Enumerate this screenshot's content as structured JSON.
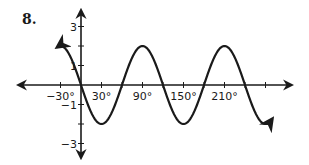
{
  "problem": {
    "number": "8."
  },
  "chart_data": {
    "type": "line",
    "title": "",
    "xlabel": "",
    "ylabel": "",
    "function": "y = -2 sin(3x)",
    "x_unit": "degrees",
    "xlim": [
      -90,
      300
    ],
    "ylim": [
      -3.5,
      3.5
    ],
    "grid": false,
    "legend": null,
    "x_ticks": [
      -30,
      30,
      90,
      150,
      210,
      270
    ],
    "x_minor_ticks": [
      0,
      60,
      120,
      180,
      240
    ],
    "x_tick_labels": [
      {
        "value": -30,
        "label": "−30°"
      },
      {
        "value": 30,
        "label": "30°"
      },
      {
        "value": 90,
        "label": "90°"
      },
      {
        "value": 150,
        "label": "150°"
      },
      {
        "value": 210,
        "label": "210°"
      }
    ],
    "y_ticks": [
      3,
      2,
      1,
      -1,
      -2,
      -3
    ],
    "y_tick_labels": [
      {
        "value": 3,
        "label": "3"
      },
      {
        "value": 1,
        "label": "1"
      },
      {
        "value": -1,
        "label": "−1"
      },
      {
        "value": -3,
        "label": "−3"
      }
    ],
    "series": [
      {
        "name": "y = -2 sin(3x)",
        "x_range": [
          -35,
          280
        ],
        "key_points": [
          {
            "x": -30,
            "y": 2
          },
          {
            "x": 0,
            "y": 0
          },
          {
            "x": 30,
            "y": -2
          },
          {
            "x": 60,
            "y": 0
          },
          {
            "x": 90,
            "y": 2
          },
          {
            "x": 120,
            "y": 0
          },
          {
            "x": 150,
            "y": -2
          },
          {
            "x": 180,
            "y": 0
          },
          {
            "x": 210,
            "y": 2
          },
          {
            "x": 240,
            "y": 0
          },
          {
            "x": 270,
            "y": -2
          }
        ],
        "arrows_both_ends": true,
        "color": "#1a1a1a"
      }
    ]
  }
}
